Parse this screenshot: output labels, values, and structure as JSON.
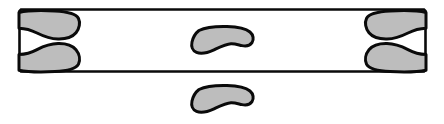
{
  "figure": {
    "title": "Schematic outline diagram",
    "canvas": {
      "width": 444,
      "height": 124
    },
    "colors": {
      "background": "#ffffff",
      "stroke": "#0a0a0a",
      "blob_fill": "#bdbdbd",
      "rect_fill": "#ffffff"
    },
    "stroke_widths": {
      "rectangle": 2.6,
      "blob": 3.0
    }
  },
  "elements": {
    "rectangle": {
      "name": "Outer rectangle frame",
      "x": 19,
      "y": 9,
      "width": 407,
      "height": 63,
      "corner_radius": 3
    },
    "blobs": [
      {
        "id": "left-upper-blob",
        "label": "Left upper lobe",
        "anchor": "left-end-inside",
        "bbox": {
          "x": 20,
          "y": 11,
          "width": 60,
          "height": 28
        }
      },
      {
        "id": "left-lower-blob",
        "label": "Left lower lobe",
        "anchor": "left-end-inside",
        "bbox": {
          "x": 20,
          "y": 43,
          "width": 60,
          "height": 28
        }
      },
      {
        "id": "center-blob",
        "label": "Center lobe",
        "anchor": "center-inside",
        "bbox": {
          "x": 192,
          "y": 27,
          "width": 62,
          "height": 27
        }
      },
      {
        "id": "right-upper-blob",
        "label": "Right upper lobe",
        "anchor": "right-end-inside",
        "bbox": {
          "x": 366,
          "y": 11,
          "width": 60,
          "height": 28
        }
      },
      {
        "id": "right-lower-blob",
        "label": "Right lower lobe",
        "anchor": "right-end-inside",
        "bbox": {
          "x": 366,
          "y": 43,
          "width": 60,
          "height": 28
        }
      },
      {
        "id": "bottom-blob",
        "label": "Detached lower lobe",
        "anchor": "below-rectangle",
        "bbox": {
          "x": 192,
          "y": 86,
          "width": 62,
          "height": 27
        }
      }
    ],
    "counts": {
      "total_blobs": 6,
      "blobs_inside_rectangle": 5,
      "blobs_outside_rectangle": 1
    }
  }
}
